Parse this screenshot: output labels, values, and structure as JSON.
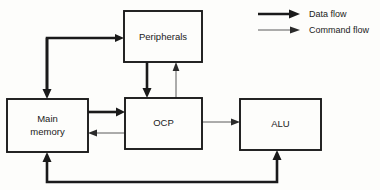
{
  "diagram": {
    "background_color": "#fdfdfb",
    "line_color": "#1a1a1a",
    "command_line_color": "#5a5a5a",
    "blocks": [
      {
        "id": "peripherals",
        "label": "Peripherals",
        "label_lines": [
          "Peripherals"
        ],
        "x": 124,
        "y": 11,
        "width": 78,
        "height": 51
      },
      {
        "id": "main-memory",
        "label": "Main memory",
        "label_lines": [
          "Main",
          "memory"
        ],
        "line1": "Main",
        "line2": "memory",
        "x": 7,
        "y": 99,
        "width": 81,
        "height": 53
      },
      {
        "id": "ocp",
        "label": "OCP",
        "label_lines": [
          "OCP"
        ],
        "x": 125,
        "y": 98,
        "width": 77,
        "height": 51
      },
      {
        "id": "alu",
        "label": "ALU",
        "label_lines": [
          "ALU"
        ],
        "x": 240,
        "y": 99,
        "width": 81,
        "height": 51
      }
    ],
    "connections": [
      {
        "id": "mm-top-to-peripherals",
        "type": "data",
        "from": "main-memory",
        "to": "peripherals"
      },
      {
        "id": "peripherals-to-ocp",
        "type": "data",
        "from": "peripherals",
        "to": "ocp"
      },
      {
        "id": "ocp-to-peripherals",
        "type": "command",
        "from": "ocp",
        "to": "peripherals"
      },
      {
        "id": "mm-to-ocp",
        "type": "data",
        "from": "main-memory",
        "to": "ocp"
      },
      {
        "id": "ocp-to-mm",
        "type": "command",
        "from": "ocp",
        "to": "main-memory"
      },
      {
        "id": "ocp-to-alu",
        "type": "command",
        "from": "ocp",
        "to": "alu"
      },
      {
        "id": "alu-to-mm-feedback",
        "type": "data",
        "from": "alu",
        "to": "main-memory"
      }
    ]
  },
  "legend": {
    "items": [
      {
        "id": "data-flow",
        "label": "Data flow",
        "type": "data"
      },
      {
        "id": "command-flow",
        "label": "Command flow",
        "type": "command"
      }
    ]
  }
}
